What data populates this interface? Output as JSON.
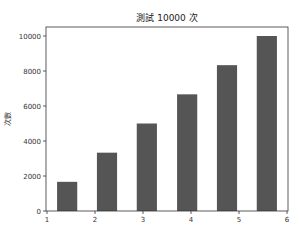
{
  "chart_data": {
    "type": "bar",
    "title": "測試 10000 次",
    "xlabel": "",
    "ylabel": "次數",
    "x_centers": [
      1.42,
      2.25,
      3.08,
      3.92,
      4.75,
      5.58
    ],
    "bar_width": 0.42,
    "values": [
      1667,
      3333,
      5000,
      6667,
      8333,
      10000
    ],
    "xlim": [
      1,
      6
    ],
    "ylim": [
      0,
      10500
    ],
    "xticks": [
      "1",
      "2",
      "3",
      "4",
      "5",
      "6"
    ],
    "yticks": [
      "0",
      "2000",
      "4000",
      "6000",
      "8000",
      "10000"
    ],
    "bar_color": "#555555",
    "grid": false,
    "legend": null
  }
}
